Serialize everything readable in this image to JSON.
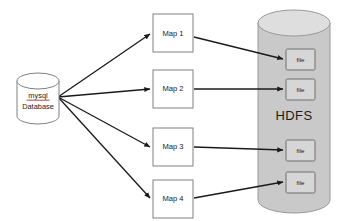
{
  "diagram": {
    "canvas": {
      "width": 342,
      "height": 221,
      "background": "#ffffff"
    },
    "colors": {
      "page_background": "#ffffff",
      "shape_stroke": "#808080",
      "cylinder_fill": "#ffffff",
      "hdfs_fill": "#c9c9c9",
      "hdfs_top_fill": "#dedede",
      "hdfs_stroke": "#9a9a9a",
      "file_fill": "#d6d6d6",
      "file_stroke": "#6e6e6e",
      "map_fill": "#ffffff",
      "arrow_color": "#1a1a1a",
      "text_color": "#1a1a1a",
      "spellcheck_underline": "#b03030"
    },
    "source": {
      "name": "mysql-database-cylinder",
      "shape": "cylinder",
      "label_line1": "mysql",
      "label_line2": "Database",
      "label_line1_spellchecked": true,
      "x": 17,
      "y": 73,
      "width": 42,
      "height": 51,
      "hub_x": 58,
      "hub_y": 97
    },
    "mappers": [
      {
        "name": "map-1",
        "label": "Map 1",
        "x": 153,
        "y": 14,
        "width": 40,
        "height": 38
      },
      {
        "name": "map-2",
        "label": "Map 2",
        "x": 153,
        "y": 70,
        "width": 40,
        "height": 38
      },
      {
        "name": "map-3",
        "label": "Map 3",
        "x": 153,
        "y": 128,
        "width": 40,
        "height": 38
      },
      {
        "name": "map-4",
        "label": "Map 4",
        "x": 153,
        "y": 180,
        "width": 40,
        "height": 38
      }
    ],
    "sink": {
      "name": "hdfs-cylinder",
      "shape": "cylinder",
      "label": "HDFS",
      "label_x": 294,
      "label_y": 117,
      "x": 258,
      "y": 10,
      "width": 72,
      "height": 203,
      "ellipse_ry": 13
    },
    "files": [
      {
        "name": "file-1",
        "label": "file",
        "x": 286,
        "y": 49,
        "width": 29,
        "height": 21
      },
      {
        "name": "file-2",
        "label": "file",
        "x": 286,
        "y": 79,
        "width": 29,
        "height": 21
      },
      {
        "name": "file-3",
        "label": "file",
        "x": 286,
        "y": 140,
        "width": 29,
        "height": 21
      },
      {
        "name": "file-4",
        "label": "file",
        "x": 286,
        "y": 172,
        "width": 29,
        "height": 21
      }
    ],
    "edges_source_to_map": [
      {
        "name": "edge-db-to-map-1",
        "from": "mysql-database-cylinder",
        "to": "map-1",
        "x1": 58,
        "y1": 97,
        "x2": 151,
        "y2": 34
      },
      {
        "name": "edge-db-to-map-2",
        "from": "mysql-database-cylinder",
        "to": "map-2",
        "x1": 58,
        "y1": 97,
        "x2": 151,
        "y2": 89
      },
      {
        "name": "edge-db-to-map-3",
        "from": "mysql-database-cylinder",
        "to": "map-3",
        "x1": 58,
        "y1": 97,
        "x2": 151,
        "y2": 147
      },
      {
        "name": "edge-db-to-map-4",
        "from": "mysql-database-cylinder",
        "to": "map-4",
        "x1": 58,
        "y1": 97,
        "x2": 151,
        "y2": 198
      }
    ],
    "edges_map_to_file": [
      {
        "name": "edge-map-1-to-file-1",
        "from": "map-1",
        "to": "file-1",
        "x1": 194,
        "y1": 37,
        "x2": 284,
        "y2": 59
      },
      {
        "name": "edge-map-2-to-file-2",
        "from": "map-2",
        "to": "file-2",
        "x1": 194,
        "y1": 89,
        "x2": 284,
        "y2": 89
      },
      {
        "name": "edge-map-3-to-file-3",
        "from": "map-3",
        "to": "file-3",
        "x1": 194,
        "y1": 147,
        "x2": 284,
        "y2": 150
      },
      {
        "name": "edge-map-4-to-file-4",
        "from": "map-4",
        "to": "file-4",
        "x1": 194,
        "y1": 198,
        "x2": 284,
        "y2": 182
      }
    ]
  }
}
